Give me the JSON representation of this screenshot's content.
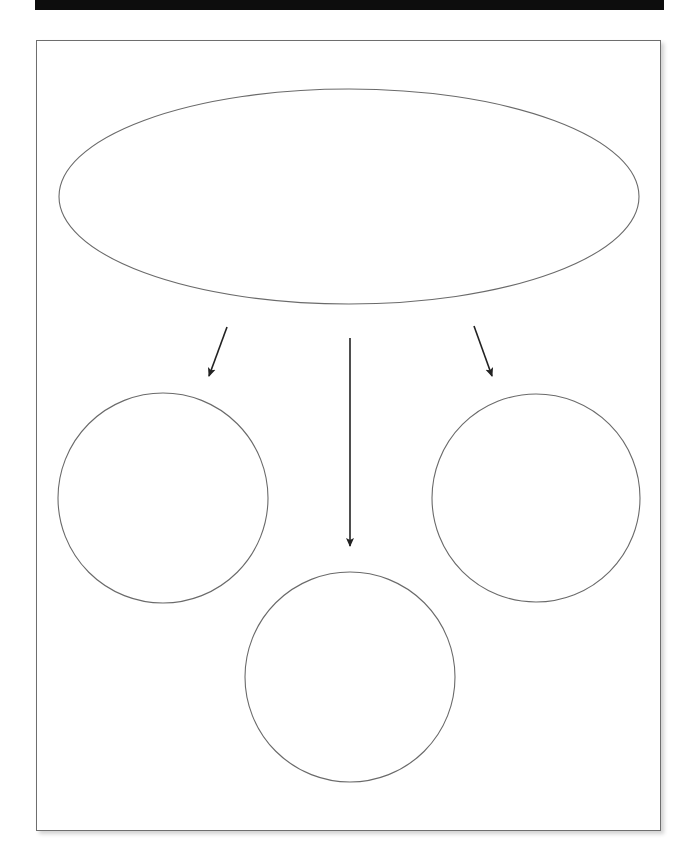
{
  "header": {
    "bar_color": "#0d0d0d",
    "title": ""
  },
  "diagram": {
    "type": "graphic-organizer",
    "stroke_color": "#6a6a6a",
    "arrow_color": "#222222",
    "main_idea": {
      "shape": "ellipse",
      "cx": 349,
      "cy": 196.5,
      "rx": 290,
      "ry": 107.5,
      "text": ""
    },
    "details": [
      {
        "id": "left",
        "shape": "circle",
        "cx": 163,
        "cy": 498,
        "r": 105,
        "text": ""
      },
      {
        "id": "center",
        "shape": "circle",
        "cx": 350,
        "cy": 677,
        "r": 105,
        "text": ""
      },
      {
        "id": "right",
        "shape": "circle",
        "cx": 536,
        "cy": 498,
        "r": 104,
        "text": ""
      }
    ],
    "arrows": [
      {
        "id": "to-left",
        "x1": 227,
        "y1": 327,
        "x2": 209,
        "y2": 376
      },
      {
        "id": "to-center",
        "x1": 350,
        "y1": 338,
        "x2": 350,
        "y2": 546
      },
      {
        "id": "to-right",
        "x1": 474,
        "y1": 326,
        "x2": 492,
        "y2": 376
      }
    ]
  }
}
